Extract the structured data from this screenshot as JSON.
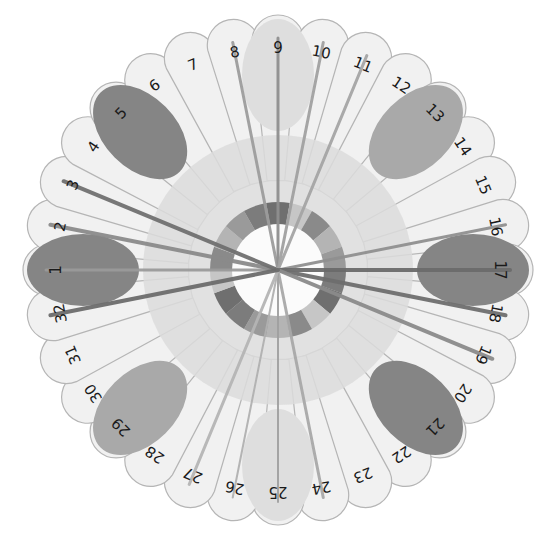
{
  "diagram": {
    "type": "radial-petal-diagram",
    "center": [
      278,
      270
    ],
    "petal_count": 32,
    "petal_outer_radius": 255,
    "label_radius": 222,
    "start_angle_deg": 180,
    "direction": "clockwise",
    "colors": {
      "background": "#ffffff",
      "petal_fill": "#f1f1f1",
      "petal_stroke": "#b5b5b5",
      "inner_disc": "#dcdcdc",
      "ring_segments": [
        "#7c7c7c",
        "#9a9a9a",
        "#b4b4b4",
        "#8a8a8a",
        "#c6c6c6",
        "#6f6f6f"
      ],
      "center_hole": "#fbfbfb",
      "spoke": "#8c8c8c",
      "ellipse_dark": "#858585",
      "ellipse_medium": "#a9a9a9",
      "ellipse_light": "#dedede",
      "label": "#1a1a1a"
    },
    "labels": [
      "1",
      "2",
      "3",
      "4",
      "5",
      "6",
      "7",
      "8",
      "9",
      "10",
      "11",
      "12",
      "13",
      "14",
      "15",
      "16",
      "17",
      "18",
      "19",
      "20",
      "21",
      "22",
      "23",
      "24",
      "25",
      "26",
      "27",
      "28",
      "29",
      "30",
      "31",
      "32"
    ],
    "highlights": [
      {
        "label": "1",
        "shade": "dark"
      },
      {
        "label": "5",
        "shade": "dark"
      },
      {
        "label": "9",
        "shade": "light"
      },
      {
        "label": "13",
        "shade": "medium"
      },
      {
        "label": "17",
        "shade": "dark"
      },
      {
        "label": "21",
        "shade": "dark"
      },
      {
        "label": "25",
        "shade": "light"
      },
      {
        "label": "29",
        "shade": "medium"
      }
    ],
    "spokes": [
      {
        "label": "1",
        "shade": "#9a9a9a",
        "width": 3
      },
      {
        "label": "2",
        "shade": "#8a8a8a",
        "width": 4
      },
      {
        "label": "3",
        "shade": "#707070",
        "width": 4
      },
      {
        "label": "8",
        "shade": "#9c9c9c",
        "width": 3
      },
      {
        "label": "9",
        "shade": "#8e8e8e",
        "width": 3
      },
      {
        "label": "10",
        "shade": "#a0a0a0",
        "width": 3
      },
      {
        "label": "11",
        "shade": "#a4a4a4",
        "width": 3
      },
      {
        "label": "16",
        "shade": "#8f8f8f",
        "width": 3
      },
      {
        "label": "17",
        "shade": "#6a6a6a",
        "width": 4
      },
      {
        "label": "18",
        "shade": "#6e6e6e",
        "width": 4
      },
      {
        "label": "19",
        "shade": "#8a8a8a",
        "width": 4
      },
      {
        "label": "24",
        "shade": "#a8a8a8",
        "width": 3
      },
      {
        "label": "25",
        "shade": "#a0a0a0",
        "width": 2
      },
      {
        "label": "26",
        "shade": "#b0b0b0",
        "width": 2
      },
      {
        "label": "27",
        "shade": "#b4b4b4",
        "width": 3
      },
      {
        "label": "32",
        "shade": "#6c6c6c",
        "width": 4
      }
    ]
  }
}
